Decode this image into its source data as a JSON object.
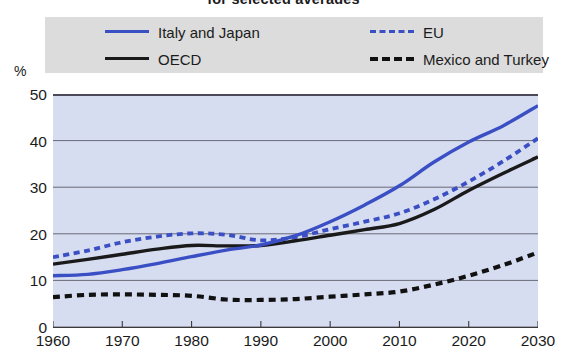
{
  "title": "for selected averages",
  "axis": {
    "y_unit": "%",
    "y_ticks": [
      "50",
      "40",
      "30",
      "20",
      "10",
      "0"
    ],
    "x_ticks": [
      "1960",
      "1970",
      "1980",
      "1990",
      "2000",
      "2010",
      "2020",
      "2030"
    ]
  },
  "colors": {
    "blue": "#3a4fc4",
    "black": "#1a1a1a",
    "plot_background": "#d7ddf1",
    "legend_background": "#dcdcdc"
  },
  "legend": {
    "items": [
      {
        "label": "Italy and Japan",
        "style": "solid",
        "color": "#3a4fc4",
        "icon": "line-solid-blue-icon"
      },
      {
        "label": "EU",
        "style": "dashed",
        "color": "#3a4fc4",
        "icon": "line-dashed-blue-icon"
      },
      {
        "label": "OECD",
        "style": "solid",
        "color": "#1a1a1a",
        "icon": "line-solid-black-icon"
      },
      {
        "label": "Mexico and Turkey",
        "style": "dashed",
        "color": "#111111",
        "icon": "line-dashed-black-icon"
      }
    ]
  },
  "chart_data": {
    "type": "line",
    "title": "for selected averages",
    "xlabel": "",
    "ylabel": "%",
    "xlim": [
      1960,
      2030
    ],
    "ylim": [
      0,
      50
    ],
    "grid": true,
    "legend_position": "top",
    "x": [
      1960,
      1965,
      1970,
      1975,
      1980,
      1985,
      1990,
      1995,
      2000,
      2005,
      2010,
      2015,
      2020,
      2025,
      2030
    ],
    "series": [
      {
        "name": "Italy and Japan",
        "style": "solid",
        "color": "#3a4fc4",
        "values": [
          11.0,
          11.3,
          12.3,
          13.6,
          15.1,
          16.5,
          17.6,
          19.6,
          22.6,
          26.2,
          30.3,
          35.4,
          39.7,
          43.2,
          47.5
        ]
      },
      {
        "name": "EU",
        "style": "dashed",
        "color": "#3a4fc4",
        "values": [
          15.0,
          16.4,
          18.2,
          19.4,
          20.1,
          19.8,
          18.6,
          19.3,
          21.0,
          22.6,
          24.4,
          27.4,
          31.2,
          35.6,
          40.5
        ]
      },
      {
        "name": "OECD",
        "style": "solid",
        "color": "#1a1a1a",
        "values": [
          13.5,
          14.5,
          15.6,
          16.7,
          17.5,
          17.4,
          17.5,
          18.5,
          19.7,
          20.9,
          22.2,
          25.2,
          29.3,
          33.0,
          36.5
        ]
      },
      {
        "name": "Mexico and Turkey",
        "style": "dashed",
        "color": "#111111",
        "values": [
          6.4,
          6.9,
          7.0,
          6.9,
          6.7,
          5.9,
          5.8,
          6.0,
          6.5,
          7.0,
          7.6,
          9.1,
          11.0,
          13.3,
          16.0
        ]
      }
    ]
  }
}
